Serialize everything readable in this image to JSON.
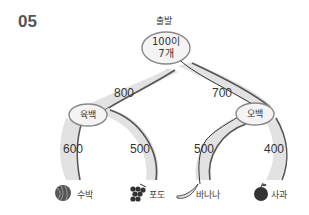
{
  "problem_number": "05",
  "start_label": "출발",
  "root_node": {
    "line1": "100이",
    "line2": "7개"
  },
  "left_node": {
    "label": "육백"
  },
  "right_node": {
    "label": "오백"
  },
  "edges": {
    "root_left": "800",
    "root_right": "700",
    "left_left": "600",
    "left_right": "500",
    "right_left": "500",
    "right_right": "400"
  },
  "leaves": [
    {
      "icon": "watermelon-icon",
      "label": "수박"
    },
    {
      "icon": "grape-icon",
      "label": "포도"
    },
    {
      "icon": "banana-icon",
      "label": "바나나"
    },
    {
      "icon": "apple-icon",
      "label": "사과"
    }
  ],
  "colors": {
    "path_fill": "#e0e0e0",
    "path_edge": "#555555",
    "node_fill": "#f4f4f4",
    "node_stroke": "#888888",
    "drawn_line": "#333333"
  }
}
